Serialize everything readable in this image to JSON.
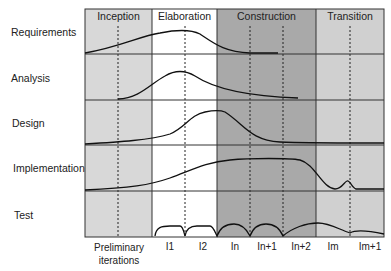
{
  "diagram": {
    "type": "rup-hump-chart",
    "phases": [
      {
        "name": "Inception",
        "x0": 85,
        "x1": 152,
        "color": "#d8d8d8"
      },
      {
        "name": "Elaboration",
        "x0": 152,
        "x1": 217,
        "color": "#ffffff"
      },
      {
        "name": "Construction",
        "x0": 217,
        "x1": 316,
        "color": "#a9a9a9"
      },
      {
        "name": "Transition",
        "x0": 316,
        "x1": 384,
        "color": "#d0d0d0"
      }
    ],
    "disciplines": [
      {
        "name": "Requirements"
      },
      {
        "name": "Analysis"
      },
      {
        "name": "Design"
      },
      {
        "name": "Implementation"
      },
      {
        "name": "Test"
      }
    ],
    "iterations": [
      {
        "label": "Preliminary\niterations",
        "line1": "Preliminary",
        "line2": "iterations"
      },
      {
        "label": "I1"
      },
      {
        "label": "I2"
      },
      {
        "label": "In"
      },
      {
        "label": "In+1"
      },
      {
        "label": "In+2"
      },
      {
        "label": "Im"
      },
      {
        "label": "Im+1"
      }
    ],
    "colors": {
      "line": "#222222",
      "grid": "#333333"
    }
  }
}
